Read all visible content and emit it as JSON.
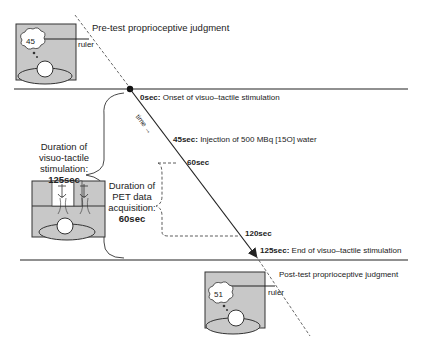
{
  "pre_test": {
    "title": "Pre-test proprioceptive judgment",
    "value": "45",
    "ruler_label": "ruler"
  },
  "post_test": {
    "title": "Post-test proprioceptive judgment",
    "value": "51",
    "ruler_label": "ruler"
  },
  "time_label": "time →",
  "events": [
    {
      "time": "0sec:",
      "text": " Onset of visuo–tactile stimulation"
    },
    {
      "time": "45sec:",
      "text": " Injection of 500 MBq [15O] water"
    },
    {
      "time": "60sec",
      "text": ""
    },
    {
      "time": "120sec",
      "text": ""
    },
    {
      "time": "125sec:",
      "text": " End of visuo–tactile stimulation"
    }
  ],
  "stimulation_duration": {
    "line1": "Duration of",
    "line2": "visuo-tactile",
    "line3": "stimulation:",
    "value": "125sec"
  },
  "pet_duration": {
    "line1": "Duration of",
    "line2": "PET data",
    "line3": "acquisition:",
    "value": "60sec"
  },
  "colors": {
    "box_fill": "#c8c8c8",
    "line": "#222222"
  }
}
